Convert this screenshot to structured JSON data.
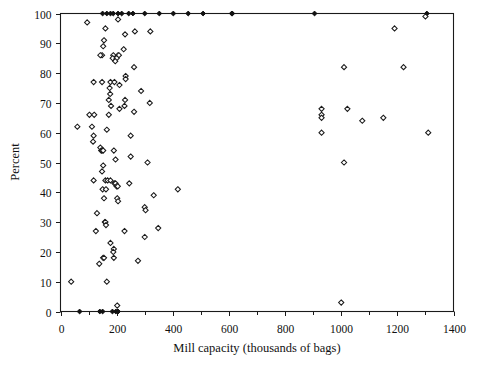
{
  "chart_data": {
    "type": "scatter",
    "title": "",
    "xlabel": "Mill capacity (thousands of bags)",
    "ylabel": "Percent",
    "xlim": [
      0,
      1400
    ],
    "ylim": [
      0,
      100
    ],
    "x_ticks_major": [
      0,
      200,
      400,
      600,
      800,
      1000,
      1200,
      1400
    ],
    "x_tick_labels": [
      "0",
      "200",
      "400",
      "600",
      "800",
      "1000",
      "1200",
      "1400"
    ],
    "x_ticks_minor": [
      100,
      300,
      500,
      700,
      900,
      1100,
      1300
    ],
    "y_ticks_major": [
      0,
      10,
      20,
      30,
      40,
      50,
      60,
      70,
      80,
      90,
      100
    ],
    "y_tick_labels": [
      "0",
      "10",
      "20",
      "30",
      "40",
      "50",
      "60",
      "70",
      "80",
      "90",
      "100"
    ],
    "grid": false,
    "legend": false,
    "marker_open": "diamond-open",
    "marker_filled": "diamond-filled",
    "series": [
      {
        "name": "Mills at 100 percent",
        "marker": "diamond-filled",
        "points": [
          [
            150,
            100
          ],
          [
            165,
            100
          ],
          [
            178,
            100
          ],
          [
            188,
            100
          ],
          [
            205,
            100
          ],
          [
            218,
            100
          ],
          [
            243,
            100
          ],
          [
            258,
            100
          ],
          [
            300,
            100
          ],
          [
            352,
            100
          ],
          [
            402,
            100
          ],
          [
            455,
            100
          ],
          [
            508,
            100
          ],
          [
            610,
            100
          ],
          [
            612,
            100
          ],
          [
            905,
            100
          ],
          [
            1305,
            100
          ]
        ]
      },
      {
        "name": "Mills at 0 percent",
        "marker": "diamond-filled",
        "points": [
          [
            68,
            0
          ],
          [
            140,
            0
          ],
          [
            150,
            0
          ],
          [
            185,
            0
          ],
          [
            197,
            0
          ],
          [
            203,
            0
          ],
          [
            205,
            0
          ]
        ]
      },
      {
        "name": "Mills between 0 and 100 percent",
        "marker": "diamond-open",
        "points": [
          [
            95,
            97
          ],
          [
            205,
            98
          ],
          [
            1300,
            99
          ],
          [
            160,
            95
          ],
          [
            1190,
            95
          ],
          [
            265,
            94
          ],
          [
            320,
            94
          ],
          [
            230,
            93
          ],
          [
            155,
            91
          ],
          [
            152,
            89
          ],
          [
            225,
            88
          ],
          [
            148,
            86
          ],
          [
            142,
            86
          ],
          [
            188,
            86
          ],
          [
            205,
            86
          ],
          [
            208,
            86
          ],
          [
            186,
            85
          ],
          [
            200,
            85
          ],
          [
            195,
            84
          ],
          [
            262,
            82
          ],
          [
            1010,
            82
          ],
          [
            1222,
            82
          ],
          [
            118,
            77
          ],
          [
            148,
            77
          ],
          [
            178,
            77
          ],
          [
            192,
            77
          ],
          [
            232,
            79
          ],
          [
            232,
            78
          ],
          [
            175,
            75
          ],
          [
            210,
            76
          ],
          [
            177,
            73
          ],
          [
            287,
            74
          ],
          [
            172,
            71
          ],
          [
            230,
            71
          ],
          [
            318,
            70
          ],
          [
            180,
            69
          ],
          [
            228,
            69
          ],
          [
            930,
            68
          ],
          [
            1022,
            68
          ],
          [
            210,
            68
          ],
          [
            262,
            67
          ],
          [
            930,
            66
          ],
          [
            930,
            65
          ],
          [
            103,
            66
          ],
          [
            120,
            66
          ],
          [
            172,
            66
          ],
          [
            1150,
            65
          ],
          [
            60,
            62
          ],
          [
            112,
            62
          ],
          [
            1075,
            64
          ],
          [
            165,
            61
          ],
          [
            930,
            60
          ],
          [
            1310,
            60
          ],
          [
            118,
            59
          ],
          [
            250,
            59
          ],
          [
            116,
            57
          ],
          [
            142,
            55
          ],
          [
            145,
            54
          ],
          [
            148,
            54
          ],
          [
            152,
            54
          ],
          [
            190,
            54
          ],
          [
            250,
            52
          ],
          [
            1010,
            50
          ],
          [
            310,
            50
          ],
          [
            196,
            51
          ],
          [
            152,
            49
          ],
          [
            148,
            47
          ],
          [
            118,
            44
          ],
          [
            160,
            44
          ],
          [
            168,
            44
          ],
          [
            178,
            44
          ],
          [
            192,
            43
          ],
          [
            196,
            43
          ],
          [
            200,
            42
          ],
          [
            204,
            42
          ],
          [
            245,
            43
          ],
          [
            150,
            41
          ],
          [
            162,
            41
          ],
          [
            332,
            39
          ],
          [
            155,
            38
          ],
          [
            202,
            38
          ],
          [
            205,
            37
          ],
          [
            418,
            41
          ],
          [
            130,
            33
          ],
          [
            300,
            35
          ],
          [
            303,
            34
          ],
          [
            158,
            30
          ],
          [
            160,
            30
          ],
          [
            162,
            29
          ],
          [
            126,
            27
          ],
          [
            228,
            27
          ],
          [
            300,
            25
          ],
          [
            348,
            28
          ],
          [
            178,
            23
          ],
          [
            190,
            21
          ],
          [
            188,
            20
          ],
          [
            152,
            18
          ],
          [
            155,
            18
          ],
          [
            190,
            18
          ],
          [
            276,
            17
          ],
          [
            138,
            16
          ],
          [
            165,
            10
          ],
          [
            38,
            10
          ],
          [
            202,
            2
          ],
          [
            1000,
            3
          ]
        ]
      }
    ]
  },
  "axes": {
    "x_title": "Mill capacity (thousands of bags)",
    "y_title": "Percent"
  }
}
